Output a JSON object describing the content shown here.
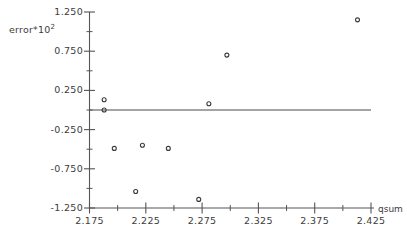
{
  "chart_data": {
    "type": "scatter",
    "title": "",
    "xlabel": "qsum",
    "ylabel": "error*10^2",
    "ylabel_base": "error*10",
    "ylabel_exponent": "2",
    "xlim": [
      2.175,
      2.425
    ],
    "ylim": [
      -1.25,
      1.25
    ],
    "grid": false,
    "legend": null,
    "xticks": [
      2.175,
      2.225,
      2.275,
      2.325,
      2.375,
      2.425
    ],
    "xtick_labels": [
      "2.175",
      "2.225",
      "2.275",
      "2.325",
      "2.375",
      "2.425"
    ],
    "x_minor_ticks": [
      2.2,
      2.25,
      2.3,
      2.35,
      2.4
    ],
    "yticks": [
      -1.25,
      -0.75,
      -0.25,
      0.25,
      0.75,
      1.25
    ],
    "ytick_labels": [
      "-1.250",
      "-0.750",
      "-0.250",
      "0.250",
      "0.750",
      "1.250"
    ],
    "y_minor_ticks": [
      -1.0,
      -0.5,
      0.0,
      0.5,
      1.0
    ],
    "reference_line": {
      "orientation": "horizontal",
      "y": 0.0,
      "x_start": 2.175,
      "x_end": 2.425
    },
    "marker": {
      "shape": "open-circle",
      "size_px": 4,
      "color": "#3a3a3a"
    },
    "x": [
      2.188,
      2.188,
      2.197,
      2.216,
      2.222,
      2.245,
      2.272,
      2.281,
      2.297,
      2.413
    ],
    "y": [
      0.13,
      0.0,
      -0.49,
      -1.04,
      -0.45,
      -0.49,
      -1.14,
      0.08,
      0.7,
      1.15
    ],
    "points": [
      {
        "x": 2.188,
        "y": 0.13
      },
      {
        "x": 2.188,
        "y": 0.0
      },
      {
        "x": 2.197,
        "y": -0.49
      },
      {
        "x": 2.216,
        "y": -1.04
      },
      {
        "x": 2.222,
        "y": -0.45
      },
      {
        "x": 2.245,
        "y": -0.49
      },
      {
        "x": 2.272,
        "y": -1.14
      },
      {
        "x": 2.281,
        "y": 0.08
      },
      {
        "x": 2.297,
        "y": 0.7
      },
      {
        "x": 2.413,
        "y": 1.15
      }
    ],
    "colors": {
      "axis": "#555555",
      "marker": "#3a3a3a",
      "reference_line": "#4a4a4a",
      "background": "#ffffff"
    }
  }
}
